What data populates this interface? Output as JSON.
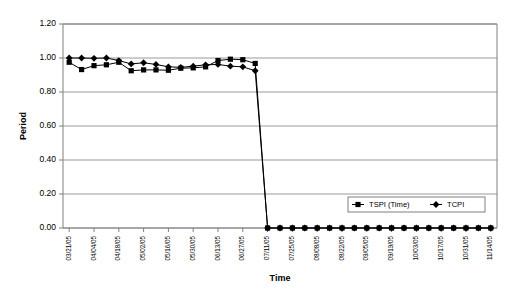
{
  "chart_data": {
    "type": "line",
    "title": "",
    "xlabel": "Time",
    "ylabel": "Period",
    "ylim": [
      0.0,
      1.2
    ],
    "ytick_labels": [
      "0.00",
      "0.20",
      "0.40",
      "0.60",
      "0.80",
      "1.00",
      "1.20"
    ],
    "ytick_values": [
      0.0,
      0.2,
      0.4,
      0.6,
      0.8,
      1.0,
      1.2
    ],
    "grid": "horizontal",
    "legend_position": "inside-bottom-right",
    "x": [
      "03/21/05",
      "03/28/05",
      "04/04/05",
      "04/11/05",
      "04/18/05",
      "04/25/05",
      "05/02/05",
      "05/09/05",
      "05/16/05",
      "05/23/05",
      "05/30/05",
      "06/06/05",
      "06/13/05",
      "06/20/05",
      "06/27/05",
      "07/04/05",
      "07/11/05",
      "07/18/05",
      "07/25/05",
      "08/01/05",
      "08/08/05",
      "08/15/05",
      "08/22/05",
      "08/29/05",
      "09/05/05",
      "09/12/05",
      "09/19/05",
      "09/26/05",
      "10/03/05",
      "10/10/05",
      "10/17/05",
      "10/24/05",
      "10/31/05",
      "11/07/05",
      "11/14/05"
    ],
    "xtick_labels_shown": [
      "03/21/05",
      "04/04/05",
      "04/18/05",
      "05/02/05",
      "05/16/05",
      "05/30/05",
      "06/13/05",
      "06/27/05",
      "07/11/05",
      "07/25/05",
      "08/08/05",
      "08/22/05",
      "09/05/05",
      "09/19/05",
      "10/03/05",
      "10/17/05",
      "10/31/05",
      "11/14/05"
    ],
    "series": [
      {
        "name": "TSPI (Time)",
        "marker": "square",
        "color": "#000000",
        "values": [
          0.975,
          0.932,
          0.955,
          0.96,
          0.975,
          0.925,
          0.93,
          0.93,
          0.928,
          0.94,
          0.942,
          0.948,
          0.985,
          0.993,
          0.99,
          0.968,
          0.0,
          0.0,
          0.0,
          0.0,
          0.0,
          0.0,
          0.0,
          0.0,
          0.0,
          0.0,
          0.0,
          0.0,
          0.0,
          0.0,
          0.0,
          0.0,
          0.0,
          0.0,
          0.0
        ]
      },
      {
        "name": "TCPI",
        "marker": "diamond",
        "color": "#000000",
        "values": [
          1.0,
          1.0,
          0.998,
          1.0,
          0.985,
          0.965,
          0.972,
          0.962,
          0.948,
          0.945,
          0.952,
          0.96,
          0.962,
          0.952,
          0.948,
          0.925,
          0.0,
          0.0,
          0.0,
          0.0,
          0.0,
          0.0,
          0.0,
          0.0,
          0.0,
          0.0,
          0.0,
          0.0,
          0.0,
          0.0,
          0.0,
          0.0,
          0.0,
          0.0,
          0.0
        ]
      }
    ]
  }
}
